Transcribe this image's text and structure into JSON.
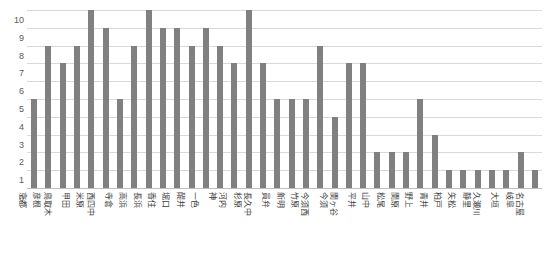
{
  "chart_data": {
    "type": "bar",
    "title": "",
    "subtitle": "",
    "xlabel": "",
    "ylabel": "",
    "ylim": [
      0,
      10
    ],
    "ytick_labels": [
      "0",
      "1",
      "2",
      "3",
      "4",
      "5",
      "6",
      "7",
      "8",
      "9",
      "10"
    ],
    "ytick_values": [
      0,
      1,
      2,
      3,
      4,
      5,
      6,
      7,
      8,
      9,
      10
    ],
    "grid": true,
    "legend": false,
    "legend_position": "none",
    "bar_color": "#808080",
    "gridline_color": "#d9d9d9",
    "axis_color": "#bfbfbf",
    "categories": [
      "京都",
      "彦根",
      "鳥取木",
      "甲田",
      "米原",
      "西四中",
      "寺倉",
      "高浜",
      "長浜",
      "香住",
      "堀口",
      "醍井",
      "一色",
      "神",
      "河内",
      "杉原",
      "長久中",
      "員弁",
      "新明",
      "竹原",
      "今須西",
      "今須",
      "関ヶ谷",
      "平井",
      "山中",
      "松尾",
      "関原",
      "野上",
      "青井",
      "柏戸",
      "矢松",
      "静里",
      "久瀬川",
      "大垣",
      "岐阜",
      "名古屋"
    ],
    "values": [
      5,
      8,
      7,
      8,
      10,
      9,
      5,
      8,
      10,
      9,
      9,
      8,
      9,
      8,
      7,
      10,
      7,
      5,
      5,
      5,
      8,
      4,
      7,
      7,
      2,
      2,
      2,
      5,
      3,
      1,
      1,
      1,
      1,
      1,
      2,
      1
    ]
  }
}
